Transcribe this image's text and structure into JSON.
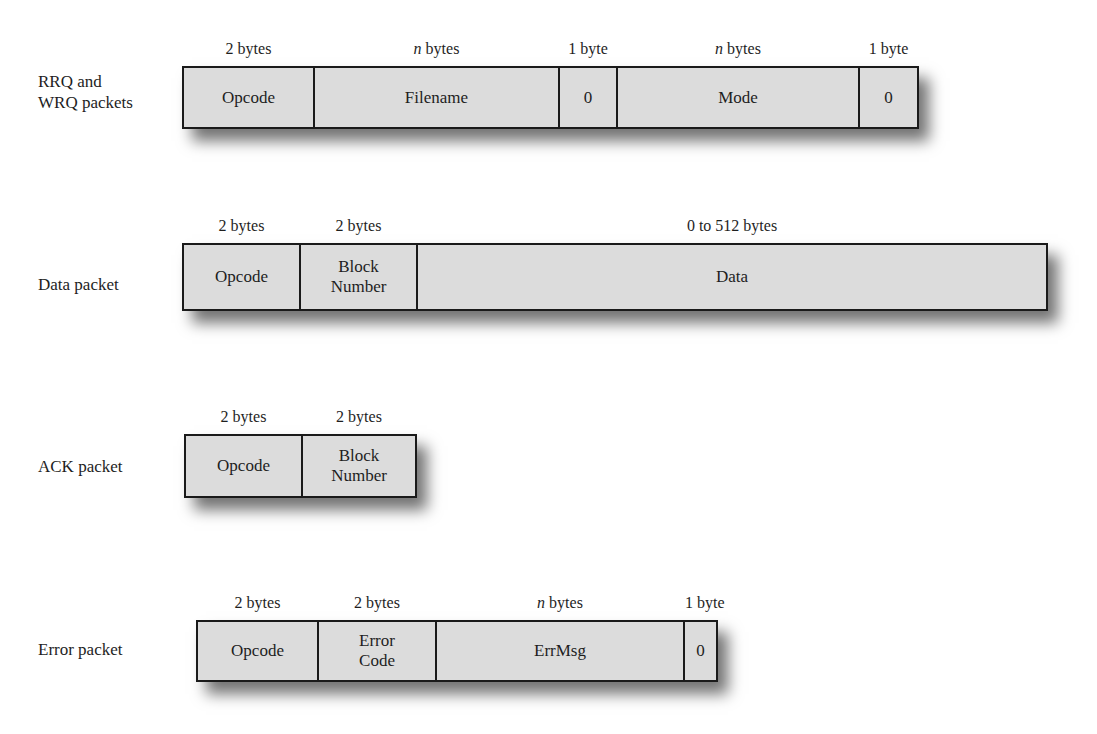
{
  "diagram": {
    "colors": {
      "cell_fill": "#dcdcdc",
      "border": "#1a1a1a",
      "text": "#1e1e1e",
      "background": "#ffffff"
    },
    "packets": [
      {
        "id": "rrq-wrq",
        "label": "RRQ and\nWRQ packets",
        "label_lines": [
          "RRQ and",
          "WRQ packets"
        ],
        "fields": [
          {
            "name": "Opcode",
            "size_num": "2",
            "size_unit": "bytes"
          },
          {
            "name": "Filename",
            "size_num": "n",
            "size_unit": "bytes"
          },
          {
            "name": "0",
            "size_num": "1",
            "size_unit": "byte"
          },
          {
            "name": "Mode",
            "size_num": "n",
            "size_unit": "bytes"
          },
          {
            "name": "0",
            "size_num": "1",
            "size_unit": "byte"
          }
        ]
      },
      {
        "id": "data",
        "label": "Data packet",
        "label_lines": [
          "Data packet"
        ],
        "fields": [
          {
            "name": "Opcode",
            "size_num": "2",
            "size_unit": "bytes"
          },
          {
            "name": "Block\nNumber",
            "size_num": "2",
            "size_unit": "bytes"
          },
          {
            "name": "Data",
            "size_num": "0 to 512",
            "size_unit": "bytes"
          }
        ]
      },
      {
        "id": "ack",
        "label": "ACK packet",
        "label_lines": [
          "ACK packet"
        ],
        "fields": [
          {
            "name": "Opcode",
            "size_num": "2",
            "size_unit": "bytes"
          },
          {
            "name": "Block\nNumber",
            "size_num": "2",
            "size_unit": "bytes"
          }
        ]
      },
      {
        "id": "error",
        "label": "Error packet",
        "label_lines": [
          "Error packet"
        ],
        "fields": [
          {
            "name": "Opcode",
            "size_num": "2",
            "size_unit": "bytes"
          },
          {
            "name": "Error\nCode",
            "size_num": "2",
            "size_unit": "bytes"
          },
          {
            "name": "ErrMsg",
            "size_num": "n",
            "size_unit": "bytes"
          },
          {
            "name": "0",
            "size_num": "1",
            "size_unit": "byte"
          }
        ]
      }
    ]
  }
}
